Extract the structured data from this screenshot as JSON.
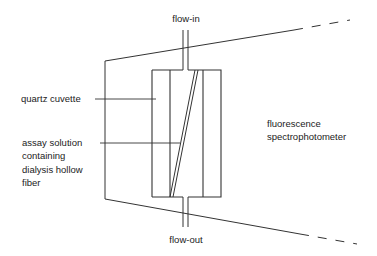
{
  "labels": {
    "flow_in": "flow-in",
    "flow_out": "flow-out",
    "quartz_cuvette": "quartz cuvette",
    "assay_line1": "assay solution",
    "assay_line2": "containing",
    "assay_line3": "dialysis hollow",
    "assay_line4": "fiber",
    "instrument_line1": "fluorescence",
    "instrument_line2": "spectrophotometer"
  },
  "colors": {
    "line": "#333333",
    "background": "#ffffff"
  }
}
